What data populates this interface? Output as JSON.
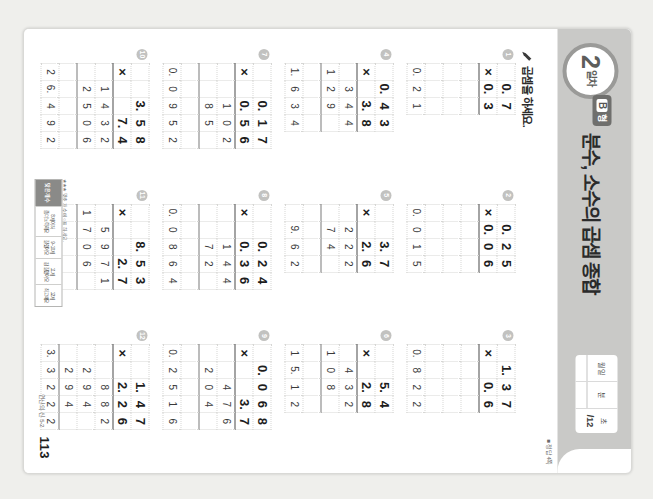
{
  "header": {
    "day_number": "2",
    "day_suffix": "일차",
    "form_label": "형",
    "form_letter": "B",
    "lesson_title": "분수, 소수의 곱셈 종합",
    "score_box": {
      "date_label": "월   일",
      "date_month_label": "월",
      "date_day_label": "일",
      "time_min_label": "분",
      "time_sec_label": "초",
      "score_value": "/12"
    },
    "answer_note": "■ 정답 4쪽"
  },
  "instruction": {
    "icon": "pencil-icon",
    "text": "곱셈을 하세요."
  },
  "footer": {
    "page_number": "113",
    "brand": "연산의 신 5-2",
    "stamp_caption": "★★★ 맞춘 개수에 ○표 하세요.",
    "stamp_header": "맞은 개수",
    "stamp_cells": [
      {
        "count": "8개 이하",
        "label": "좀더 노력해요"
      },
      {
        "count": "9~10개",
        "label": "잘했어요"
      },
      {
        "count": "11개",
        "label": "참 잘했어요"
      },
      {
        "count": "12개",
        "label": "최고예요"
      }
    ]
  },
  "colors": {
    "band": "#c9c9c7",
    "title": "#2b2b2b",
    "rule": "#4a4a4a",
    "grid_line": "#d6d6d4",
    "badge": "#c2c2c0"
  },
  "problems": [
    {
      "number": "1",
      "multiplicand": [
        "0.",
        "7"
      ],
      "multiplier": [
        "0.",
        "3"
      ],
      "operator": "×",
      "partials": [],
      "result": [
        "0.",
        "2",
        "1"
      ],
      "cols": 3
    },
    {
      "number": "2",
      "multiplicand": [
        "0.",
        "2",
        "5"
      ],
      "multiplier": [
        "0.",
        "0",
        "6"
      ],
      "operator": "×",
      "partials": [],
      "result": [
        "0.",
        "0",
        "1",
        "5"
      ],
      "cols": 4
    },
    {
      "number": "3",
      "multiplicand": [
        "1.",
        "3",
        "7"
      ],
      "multiplier": [
        "0.",
        "6"
      ],
      "operator": "×",
      "partials": [],
      "result": [
        "0.",
        "8",
        "2",
        "2"
      ],
      "cols": 4
    },
    {
      "number": "4",
      "multiplicand": [
        "0.",
        "4",
        "3"
      ],
      "multiplier": [
        "3.",
        "8"
      ],
      "operator": "×",
      "partials": [
        [
          "",
          "3",
          "4",
          "4"
        ],
        [
          "1",
          "2",
          "9",
          ""
        ]
      ],
      "result": [
        "1.",
        "6",
        "3",
        "4"
      ],
      "cols": 4
    },
    {
      "number": "5",
      "multiplicand": [
        "3.",
        "7"
      ],
      "multiplier": [
        "2.",
        "6"
      ],
      "operator": "×",
      "partials": [
        [
          "",
          "2",
          "2",
          "2"
        ],
        [
          "",
          "7",
          "4",
          ""
        ]
      ],
      "result": [
        "9.",
        "6",
        "2"
      ],
      "cols": 4
    },
    {
      "number": "6",
      "multiplicand": [
        "5.",
        "4"
      ],
      "multiplier": [
        "2.",
        "8"
      ],
      "operator": "×",
      "partials": [
        [
          "",
          "4",
          "3",
          "2"
        ],
        [
          "1",
          "0",
          "8",
          ""
        ]
      ],
      "result": [
        "1",
        "5.",
        "1",
        "2"
      ],
      "cols": 4
    },
    {
      "number": "7",
      "multiplicand": [
        "0.",
        "1",
        "7"
      ],
      "multiplier": [
        "0.",
        "5",
        "6"
      ],
      "operator": "×",
      "partials": [
        [
          "",
          "1",
          "0",
          "2"
        ],
        [
          "",
          "8",
          "5",
          ""
        ]
      ],
      "result": [
        "0.",
        "0",
        "9",
        "5",
        "2"
      ],
      "cols": 5
    },
    {
      "number": "8",
      "multiplicand": [
        "0.",
        "2",
        "4"
      ],
      "multiplier": [
        "0.",
        "3",
        "6"
      ],
      "operator": "×",
      "partials": [
        [
          "",
          "1",
          "4",
          "4"
        ],
        [
          "",
          "7",
          "2",
          ""
        ]
      ],
      "result": [
        "0.",
        "0",
        "8",
        "6",
        "4"
      ],
      "cols": 5
    },
    {
      "number": "9",
      "multiplicand": [
        "0.",
        "0",
        "6",
        "8"
      ],
      "multiplier": [
        "3.",
        "7"
      ],
      "operator": "×",
      "partials": [
        [
          "",
          "4",
          "7",
          "6"
        ],
        [
          "2",
          "0",
          "4",
          ""
        ]
      ],
      "result": [
        "0.",
        "2",
        "5",
        "1",
        "6"
      ],
      "cols": 5
    },
    {
      "number": "10",
      "multiplicand": [
        "3.",
        "5",
        "8"
      ],
      "multiplier": [
        "7.",
        "4"
      ],
      "operator": "×",
      "partials": [
        [
          "1",
          "4",
          "3",
          "2"
        ],
        [
          "2",
          "5",
          "0",
          "6"
        ]
      ],
      "result": [
        "2",
        "6.",
        "4",
        "9",
        "2"
      ],
      "cols": 5
    },
    {
      "number": "11",
      "multiplicand": [
        "8.",
        "5",
        "3"
      ],
      "multiplier": [
        "2.",
        "7"
      ],
      "operator": "×",
      "partials": [
        [
          "",
          "5",
          "9",
          "7",
          "1"
        ],
        [
          "1",
          "7",
          "0",
          "6",
          ""
        ]
      ],
      "result": [
        "2",
        "3.",
        "0",
        "3",
        "1"
      ],
      "cols": 5
    },
    {
      "number": "12",
      "multiplicand": [
        "1.",
        "4",
        "7"
      ],
      "multiplier": [
        "2.",
        "2",
        "6"
      ],
      "operator": "×",
      "partials": [
        [
          "",
          "8",
          "8",
          "2"
        ],
        [
          "2",
          "9",
          "4",
          ""
        ],
        [
          "2",
          "9",
          "4",
          ""
        ]
      ],
      "result": [
        "3.",
        "3",
        "2",
        "2",
        "2"
      ],
      "cols": 5
    }
  ]
}
